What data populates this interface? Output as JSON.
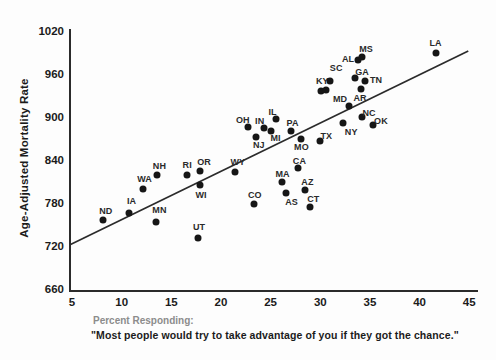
{
  "figure": {
    "y_axis_label": "Age-Adjusted Mortality Rate",
    "x_caption_line1": "Percent Responding:",
    "x_caption_line2": "\"Most people would try to take advantage of you if they got the chance.\""
  },
  "colors": {
    "background": "#fdfdfd",
    "axis": "#2b2b2b",
    "point": "#161616",
    "tick_text": "#1b1b1b",
    "state_label": "#2a2a2a",
    "caption_gray": "#8c8c8c",
    "caption_black": "#1b1b1b",
    "trend_line": "#2b2b2b"
  },
  "chart_data": {
    "type": "scatter",
    "title": "",
    "xlabel": "Percent Responding: \"Most people would try to take advantage of you if they got the chance.\"",
    "ylabel": "Age-Adjusted Mortality Rate",
    "xlim": [
      5,
      45
    ],
    "ylim": [
      660,
      1020
    ],
    "x_ticks": [
      5,
      10,
      15,
      20,
      25,
      30,
      35,
      40,
      45
    ],
    "y_ticks": [
      660,
      720,
      780,
      840,
      900,
      960,
      1020
    ],
    "grid": false,
    "legend": false,
    "trendline": {
      "x1": 4.8,
      "y1": 722,
      "x2": 44.9,
      "y2": 992
    },
    "points": [
      {
        "label": "ND",
        "x": 8.1,
        "y": 757,
        "dx": 3,
        "dy": -9
      },
      {
        "label": "IA",
        "x": 10.7,
        "y": 767,
        "dx": 3,
        "dy": -12
      },
      {
        "label": "WA",
        "x": 12.1,
        "y": 800,
        "dx": 2,
        "dy": -10
      },
      {
        "label": "NH",
        "x": 13.6,
        "y": 820,
        "dx": 2,
        "dy": -9
      },
      {
        "label": "MN",
        "x": 13.5,
        "y": 754,
        "dx": 3,
        "dy": -12
      },
      {
        "label": "RI",
        "x": 16.6,
        "y": 819,
        "dx": 0,
        "dy": -10
      },
      {
        "label": "OR",
        "x": 17.9,
        "y": 825,
        "dx": 4,
        "dy": -9
      },
      {
        "label": "WI",
        "x": 17.9,
        "y": 806,
        "dx": 1,
        "dy": 10
      },
      {
        "label": "UT",
        "x": 17.7,
        "y": 732,
        "dx": 1,
        "dy": -11
      },
      {
        "label": "WY",
        "x": 21.4,
        "y": 824,
        "dx": 3,
        "dy": -10
      },
      {
        "label": "CO",
        "x": 23.3,
        "y": 779,
        "dx": 1,
        "dy": -9
      },
      {
        "label": "OH",
        "x": 22.7,
        "y": 886,
        "dx": -5,
        "dy": -7
      },
      {
        "label": "NJ",
        "x": 23.5,
        "y": 872,
        "dx": 3,
        "dy": 8
      },
      {
        "label": "IN",
        "x": 24.3,
        "y": 885,
        "dx": -4,
        "dy": -7
      },
      {
        "label": "MI",
        "x": 25.0,
        "y": 880,
        "dx": 5,
        "dy": 7
      },
      {
        "label": "IL",
        "x": 25.5,
        "y": 897,
        "dx": -3,
        "dy": -7
      },
      {
        "label": "PA",
        "x": 27.0,
        "y": 881,
        "dx": 2,
        "dy": -8
      },
      {
        "label": "MO",
        "x": 28.1,
        "y": 870,
        "dx": 0,
        "dy": 8
      },
      {
        "label": "MA",
        "x": 26.1,
        "y": 809,
        "dx": 1,
        "dy": -8
      },
      {
        "label": "AS",
        "x": 26.5,
        "y": 794,
        "dx": 6,
        "dy": 9
      },
      {
        "label": "CA",
        "x": 27.8,
        "y": 829,
        "dx": 1,
        "dy": -7
      },
      {
        "label": "AZ",
        "x": 28.5,
        "y": 799,
        "dx": 2,
        "dy": -8
      },
      {
        "label": "CT",
        "x": 29.0,
        "y": 775,
        "dx": 3,
        "dy": -8
      },
      {
        "label": "TX",
        "x": 30.0,
        "y": 867,
        "dx": 6,
        "dy": -5
      },
      {
        "label": "KY",
        "x": 30.1,
        "y": 937,
        "dx": 1,
        "dy": -10
      },
      {
        "label": "",
        "x": 30.6,
        "y": 938,
        "dx": 0,
        "dy": 0
      },
      {
        "label": "SC",
        "x": 31.0,
        "y": 950,
        "dx": 6,
        "dy": -13
      },
      {
        "label": "NY",
        "x": 32.3,
        "y": 892,
        "dx": 8,
        "dy": 9
      },
      {
        "label": "MD",
        "x": 32.9,
        "y": 915,
        "dx": -9,
        "dy": -7
      },
      {
        "label": "NC",
        "x": 34.2,
        "y": 900,
        "dx": 7,
        "dy": -4
      },
      {
        "label": "OK",
        "x": 35.3,
        "y": 889,
        "dx": 8,
        "dy": -4
      },
      {
        "label": "AR",
        "x": 34.1,
        "y": 939,
        "dx": -1,
        "dy": 9
      },
      {
        "label": "GA",
        "x": 33.5,
        "y": 955,
        "dx": 7,
        "dy": -6
      },
      {
        "label": "TN",
        "x": 34.5,
        "y": 950,
        "dx": 11,
        "dy": -1
      },
      {
        "label": "AL",
        "x": 33.8,
        "y": 980,
        "dx": -10,
        "dy": -1
      },
      {
        "label": "MS",
        "x": 34.2,
        "y": 984,
        "dx": 4,
        "dy": -8
      },
      {
        "label": "LA",
        "x": 41.6,
        "y": 989,
        "dx": 0,
        "dy": -10
      }
    ]
  }
}
